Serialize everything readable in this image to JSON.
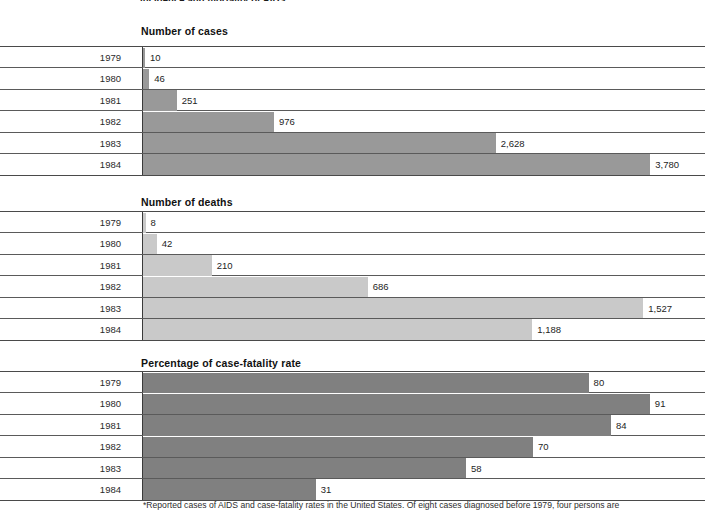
{
  "document": {
    "cut_off_title": "Incidence and mortality of AIDS",
    "footnote": "*Reported cases of AIDS and case-fatality rates in the United States. Of eight cases diagnosed before 1979, four persons are"
  },
  "colors": {
    "cases_bar": "#999999",
    "deaths_bar": "#c9c9c9",
    "fatality_bar": "#808080",
    "rule": "#5a5a5a",
    "axis": "#3a3a3a",
    "text": "#1d1d1d",
    "page_background": "#ffffff"
  },
  "chart_data": [
    {
      "type": "bar",
      "orientation": "horizontal",
      "title": "Number of cases",
      "xlabel": "",
      "ylabel": "",
      "categories": [
        "1979",
        "1980",
        "1981",
        "1982",
        "1983",
        "1984"
      ],
      "values": [
        10,
        46,
        251,
        976,
        2628,
        3780
      ],
      "value_labels": [
        "10",
        "46",
        "251",
        "976",
        "2,628",
        "3,780"
      ],
      "xlim": [
        0,
        4150
      ],
      "grid": false,
      "legend": "none",
      "bar_color": "#999999"
    },
    {
      "type": "bar",
      "orientation": "horizontal",
      "title": "Number of deaths",
      "xlabel": "",
      "ylabel": "",
      "categories": [
        "1979",
        "1980",
        "1981",
        "1982",
        "1983",
        "1984"
      ],
      "values": [
        8,
        42,
        210,
        686,
        1527,
        1188
      ],
      "value_labels": [
        "8",
        "42",
        "210",
        "686",
        "1,527",
        "1,188"
      ],
      "xlim": [
        0,
        1700
      ],
      "grid": false,
      "legend": "none",
      "bar_color": "#c9c9c9"
    },
    {
      "type": "bar",
      "orientation": "horizontal",
      "title": "Percentage of case-fatality rate",
      "xlabel": "",
      "ylabel": "",
      "categories": [
        "1979",
        "1980",
        "1981",
        "1982",
        "1983",
        "1984"
      ],
      "values": [
        80,
        91,
        84,
        70,
        58,
        31
      ],
      "value_labels": [
        "80",
        "91",
        "84",
        "70",
        "58",
        "31"
      ],
      "xlim": [
        0,
        100
      ],
      "grid": false,
      "legend": "none",
      "bar_color": "#808080"
    }
  ]
}
